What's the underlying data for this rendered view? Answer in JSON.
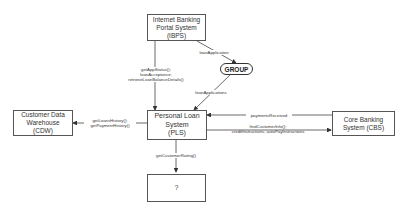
{
  "nodes": {
    "ibps": {
      "label": "Internet Banking\nPortal System\n(IBPS)"
    },
    "group": {
      "label": "GROUP"
    },
    "pls": {
      "label": "Personal Loan\nSystem\n(PLS)"
    },
    "cdw": {
      "label": "Customer Data\nWarehouse\n(CDW)"
    },
    "cbs": {
      "label": "Core Banking\nSystem (CBS)"
    },
    "unknown": {
      "label": "?"
    }
  },
  "edges": {
    "ibps_to_pls": {
      "label": "getAppStatus();\nloanAcceptance;\nretrieveLoanBalanceDetails()"
    },
    "ibps_to_group": {
      "label": "loanApplication"
    },
    "group_to_pls": {
      "label": "loanApplications"
    },
    "pls_to_cdw": {
      "label": "getLoansHistory();\ngetPaymentHistory()"
    },
    "cbs_to_pls": {
      "label": "paymentsReceived"
    },
    "pls_to_cbs": {
      "label": "findCustomerInfo();\ncreditInstructions; autoPayInstructions"
    },
    "pls_to_unknown": {
      "label": "getCustomerRating()"
    }
  }
}
